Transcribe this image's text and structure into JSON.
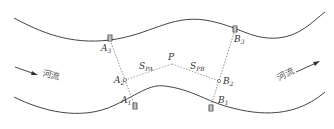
{
  "diagram": {
    "flow_label_left": "河流",
    "flow_label_right": "河流",
    "point_P": "P",
    "section_A": {
      "top": {
        "letter": "A",
        "sub": "3"
      },
      "mid": {
        "letter": "A",
        "sub": "2"
      },
      "bottom": {
        "letter": "A",
        "sub": "1"
      }
    },
    "section_B": {
      "top": {
        "letter": "B",
        "sub": "3"
      },
      "mid": {
        "letter": "B",
        "sub": "2"
      },
      "bottom": {
        "letter": "B",
        "sub": "1"
      }
    },
    "distance_PA": {
      "letter": "S",
      "sub": "PA"
    },
    "distance_PB": {
      "letter": "S",
      "sub": "PB"
    },
    "colors": {
      "bank_line": "#444444",
      "dotted_line": "#777777",
      "text": "#333333"
    }
  }
}
